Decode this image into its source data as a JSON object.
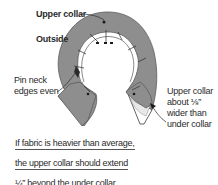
{
  "diagram": {
    "labels": {
      "upper_collar": "Upper collar",
      "outside": "Outside",
      "pin_neck_line1": "Pin neck",
      "pin_neck_line2": "edges even",
      "wider_line1": "Upper collar",
      "wider_line2": "about ⅛”",
      "wider_line3": "wider than",
      "wider_line4": "under collar"
    },
    "note": {
      "lines": [
        "If fabric is heavier than average,",
        "the upper collar should extend",
        "¼” beyond the under collar."
      ]
    },
    "colors": {
      "fabric": "#8e8e8e",
      "fabric_edge": "#5a5a5a",
      "under_collar": "#ffffff",
      "text": "#2a2a2a"
    }
  }
}
